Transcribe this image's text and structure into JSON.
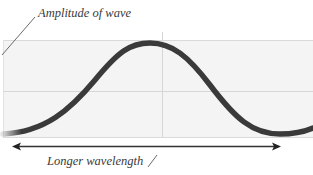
{
  "diagram": {
    "labels": {
      "amplitude": "Amplitude of wave",
      "wavelength": "Longer wavelength"
    },
    "colors": {
      "panel_fill": "#f4f4f4",
      "gridline": "#d6d6d6",
      "wave": "#3a3a3a",
      "arrow": "#333333",
      "leader_line": "#6a6a6a"
    },
    "wave": {
      "type": "sine",
      "peak_x": 150,
      "trough_x": 280,
      "description": "long-wavelength wave, single crest and trough"
    },
    "arrow": {
      "direction": "double-headed horizontal",
      "meaning": "wavelength span"
    }
  }
}
